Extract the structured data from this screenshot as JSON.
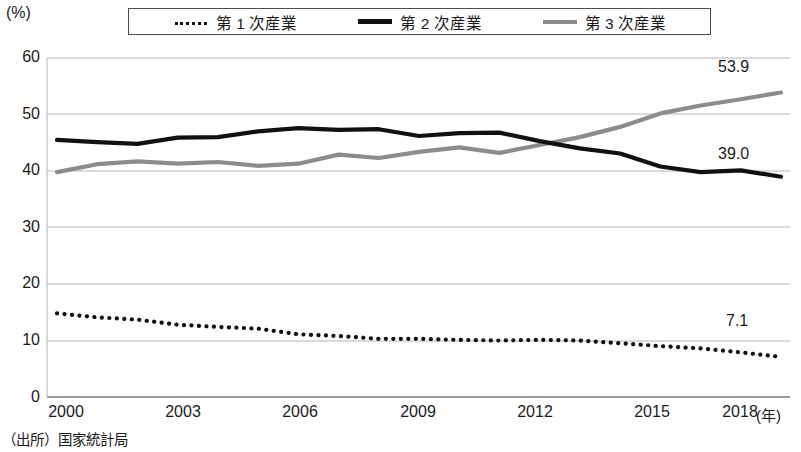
{
  "axis": {
    "unit_label": "(%)",
    "x_unit_label": "(年)",
    "y_ticks": [
      "60",
      "50",
      "40",
      "30",
      "20",
      "10",
      "0"
    ],
    "x_ticks": [
      "2000",
      "2003",
      "2006",
      "2009",
      "2012",
      "2015",
      "2018"
    ]
  },
  "legend": {
    "items": [
      {
        "label": "第 1 次産業",
        "style": "dotted",
        "color": "#111111"
      },
      {
        "label": "第 2 次産業",
        "style": "solid-black",
        "color": "#111111"
      },
      {
        "label": "第 3 次産業",
        "style": "solid-gray",
        "color": "#8c8c8c"
      }
    ]
  },
  "annotations": {
    "tertiary_end": "53.9",
    "secondary_end": "39.0",
    "primary_end": "7.1"
  },
  "source": "（出所）国家統計局",
  "chart_data": {
    "type": "line",
    "title": "",
    "subtitle": "",
    "xlabel": "(年)",
    "ylabel": "(%)",
    "xlim": [
      2000,
      2018
    ],
    "ylim": [
      0,
      60
    ],
    "grid": true,
    "legend_position": "top-center",
    "x": [
      2000,
      2001,
      2002,
      2003,
      2004,
      2005,
      2006,
      2007,
      2008,
      2009,
      2010,
      2011,
      2012,
      2013,
      2014,
      2015,
      2016,
      2017,
      2018
    ],
    "categories": [
      "2000",
      "2001",
      "2002",
      "2003",
      "2004",
      "2005",
      "2006",
      "2007",
      "2008",
      "2009",
      "2010",
      "2011",
      "2012",
      "2013",
      "2014",
      "2015",
      "2016",
      "2017",
      "2018"
    ],
    "series": [
      {
        "name": "第 1 次産業",
        "style": "dotted",
        "color": "#111111",
        "values": [
          14.8,
          14.1,
          13.7,
          12.8,
          12.4,
          12.1,
          11.1,
          10.8,
          10.3,
          10.3,
          10.1,
          10.0,
          10.1,
          10.0,
          9.5,
          9.0,
          8.6,
          7.9,
          7.1
        ],
        "end_label": "7.1"
      },
      {
        "name": "第 2 次産業",
        "style": "solid",
        "color": "#111111",
        "values": [
          45.5,
          45.1,
          44.8,
          45.9,
          46.0,
          47.0,
          47.6,
          47.3,
          47.4,
          46.2,
          46.7,
          46.8,
          45.3,
          44.0,
          43.1,
          40.8,
          39.8,
          40.1,
          39.0
        ],
        "end_label": "39.0"
      },
      {
        "name": "第 3 次産業",
        "style": "solid",
        "color": "#8c8c8c",
        "values": [
          39.8,
          41.2,
          41.7,
          41.3,
          41.6,
          40.9,
          41.3,
          42.9,
          42.3,
          43.4,
          44.2,
          43.2,
          44.6,
          46.0,
          47.8,
          50.2,
          51.6,
          52.7,
          53.9
        ],
        "end_label": "53.9"
      }
    ]
  }
}
